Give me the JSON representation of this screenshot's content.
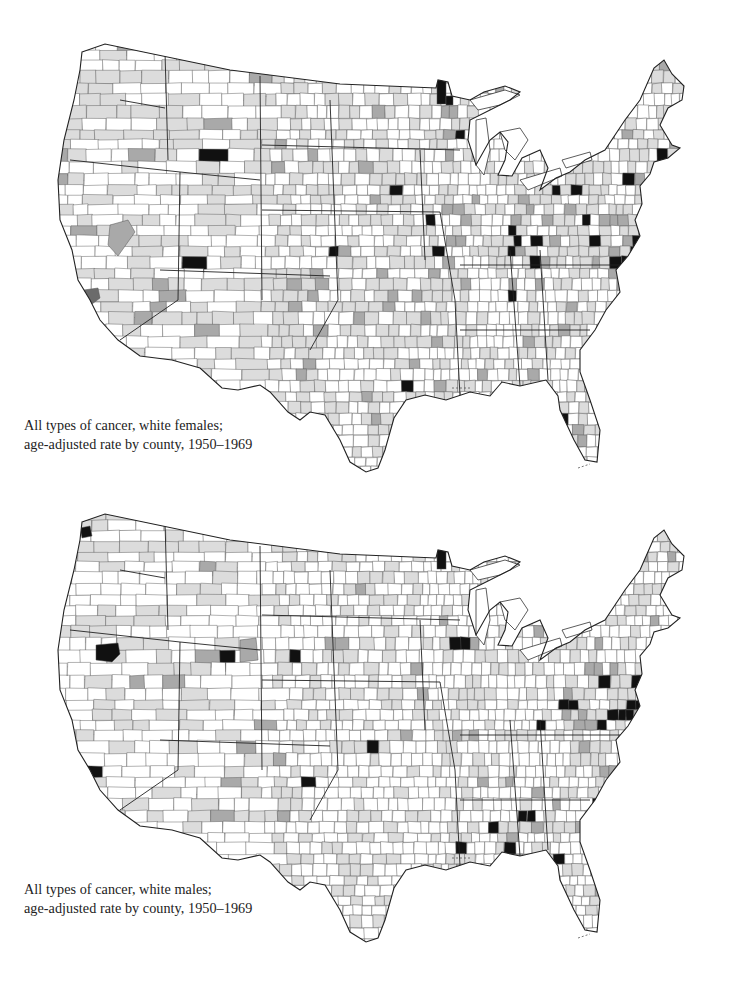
{
  "maps": [
    {
      "id": "females",
      "caption_line1": "All types of cancer, white females;",
      "caption_line2": "age-adjusted rate by county, 1950–1969",
      "seed": 17,
      "density": {
        "light": 0.4,
        "medium": 0.05,
        "black": 0.006
      },
      "hotspots": [
        {
          "x": 640,
          "y": 250,
          "r": 55,
          "black": 0.55,
          "medium": 0.15
        },
        {
          "x": 655,
          "y": 175,
          "r": 30,
          "black": 0.35,
          "medium": 0.25
        },
        {
          "x": 560,
          "y": 200,
          "r": 55,
          "black": 0.15,
          "medium": 0.08
        },
        {
          "x": 450,
          "y": 260,
          "r": 40,
          "black": 0.1,
          "medium": 0.05
        },
        {
          "x": 510,
          "y": 245,
          "r": 40,
          "black": 0.1,
          "medium": 0.05
        }
      ],
      "solid_regions": [
        {
          "shape": "rect",
          "x": 437,
          "y": 78,
          "w": 9,
          "h": 26,
          "shade": "black"
        },
        {
          "shape": "rect",
          "x": 446,
          "y": 96,
          "w": 7,
          "h": 9,
          "shade": "black"
        },
        {
          "shape": "poly",
          "points": "84,290 98,288 100,298 92,304 84,300",
          "shade": "dark"
        },
        {
          "shape": "poly",
          "points": "110,225 128,220 135,232 118,256 108,245",
          "shade": "medium"
        }
      ],
      "colors": {
        "white": "#ffffff",
        "light": "#dcdcdc",
        "medium": "#a9a9a9",
        "dark": "#6b6b6b",
        "black": "#111111",
        "line": "#555555"
      }
    },
    {
      "id": "males",
      "caption_line1": "All types of cancer, white males;",
      "caption_line2": "age-adjusted rate by county, 1950–1969",
      "seed": 53,
      "density": {
        "light": 0.28,
        "medium": 0.04,
        "black": 0.008
      },
      "hotspots": [
        {
          "x": 645,
          "y": 705,
          "r": 50,
          "black": 0.45,
          "medium": 0.15
        },
        {
          "x": 525,
          "y": 835,
          "r": 40,
          "black": 0.35,
          "medium": 0.1
        },
        {
          "x": 555,
          "y": 700,
          "r": 45,
          "black": 0.15,
          "medium": 0.08
        },
        {
          "x": 460,
          "y": 840,
          "r": 35,
          "black": 0.15,
          "medium": 0.1
        },
        {
          "x": 605,
          "y": 780,
          "r": 35,
          "black": 0.12,
          "medium": 0.06
        }
      ],
      "solid_regions": [
        {
          "shape": "rect",
          "x": 437,
          "y": 545,
          "w": 9,
          "h": 24,
          "shade": "black"
        },
        {
          "shape": "poly",
          "points": "96,645 118,643 120,654 112,662 96,660",
          "shade": "black"
        },
        {
          "shape": "poly",
          "points": "80,528 90,526 92,536 82,538",
          "shade": "black"
        },
        {
          "shape": "poly",
          "points": "240,640 256,638 258,660 240,662",
          "shade": "medium"
        },
        {
          "shape": "poly",
          "points": "604,915 616,913 618,930 606,932",
          "shade": "black"
        }
      ],
      "colors": {
        "white": "#ffffff",
        "light": "#dcdcdc",
        "medium": "#a9a9a9",
        "dark": "#6b6b6b",
        "black": "#111111",
        "line": "#555555"
      }
    }
  ],
  "outline": {
    "path": "M 82 52 L 105 44 L 230 70 L 340 84 L 436 88 L 438 80 L 448 82 L 452 96 L 470 100 L 484 92 L 505 86 L 520 92 L 510 100 L 490 110 L 470 120 L 468 140 L 476 165 L 490 140 L 500 132 L 508 142 L 505 160 L 498 175 L 512 176 L 522 158 L 540 150 L 548 168 L 540 190 L 556 178 L 570 172 L 585 160 L 605 150 L 625 120 L 640 100 L 654 68 L 664 60 L 672 74 L 684 86 L 682 100 L 668 108 L 660 125 L 672 145 L 680 148 L 668 158 L 654 162 L 650 174 L 640 186 L 642 204 L 635 220 L 640 236 L 628 256 L 616 270 L 620 292 L 606 310 L 595 330 L 580 350 L 580 372 L 590 400 L 600 430 L 597 462 L 585 460 L 574 440 L 560 410 L 558 396 L 546 380 L 520 386 L 502 382 L 490 396 L 470 392 L 446 400 L 425 395 L 406 400 L 394 418 L 385 450 L 378 468 L 366 472 L 350 462 L 340 440 L 325 415 L 310 412 L 300 420 L 288 412 L 270 392 L 260 385 L 238 390 L 222 388 L 200 368 L 172 360 L 140 356 L 118 340 L 100 320 L 90 300 L 78 280 L 72 250 L 60 220 L 58 180 L 64 140 L 74 100 L 80 70 Z",
    "offset_y_second": 470,
    "gulf_islands": [
      {
        "x1": 452,
        "y1": 388,
        "x2": 470,
        "y2": 388
      },
      {
        "x1": 578,
        "y1": 468,
        "x2": 590,
        "y2": 464
      }
    ],
    "state_lines": [
      "M 70 160 L 180 172 L 260 180",
      "M 120 100 L 165 108",
      "M 165 52 L 168 160",
      "M 260 76 L 262 300",
      "M 180 172 L 178 300",
      "M 160 270 L 330 276",
      "M 178 300 L 120 340",
      "M 262 210 L 440 212",
      "M 330 100 L 338 300",
      "M 338 300 L 310 350",
      "M 262 145 L 460 150",
      "M 440 212 L 455 300",
      "M 455 300 L 460 396",
      "M 460 330 L 590 330",
      "M 510 250 L 520 386",
      "M 540 250 L 548 380",
      "M 460 265 L 620 265",
      "M 420 150 L 425 260"
    ]
  }
}
